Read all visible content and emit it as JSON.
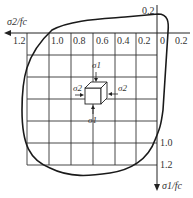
{
  "diagram": {
    "x_axis": {
      "label": "σ2/fc",
      "direction": "left",
      "ticks": [
        "1.2",
        "1.0",
        "0.8",
        "0.6",
        "0.4",
        "0.2",
        "0",
        "0.2"
      ]
    },
    "y_axis": {
      "label": "σ1/fc",
      "direction": "down",
      "ticks": [
        "0.2",
        "1.0",
        "1.2"
      ]
    },
    "element": {
      "stress_labels": {
        "top": "σ1",
        "bottom": "σ1",
        "left": "σ2",
        "right": "σ2"
      }
    },
    "colors": {
      "line": "#1a1a1a",
      "grid": "#333333",
      "background": "#ffffff"
    }
  }
}
